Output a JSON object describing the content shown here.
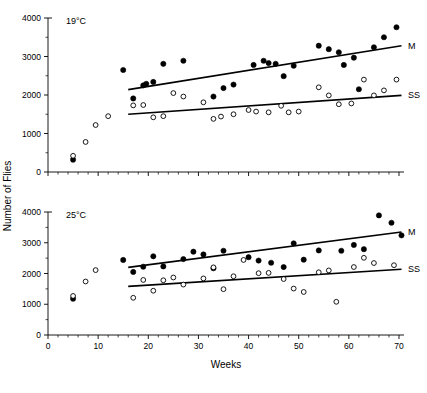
{
  "figure": {
    "width": 427,
    "height": 393,
    "background": "#ffffff",
    "ink_color": "#000000"
  },
  "axis_titles": {
    "y": "Number of Flies",
    "x": "Weeks"
  },
  "chart_data": [
    {
      "type": "scatter",
      "panel_id": "top",
      "title": "19°C",
      "xlabel": "Weeks",
      "ylabel": "Number of Flies",
      "xlim": [
        0,
        71
      ],
      "ylim": [
        0,
        4000
      ],
      "xticks": [
        0,
        10,
        20,
        30,
        40,
        50,
        60,
        70
      ],
      "xtick_labels": [
        "0",
        "10",
        "20",
        "30",
        "40",
        "50",
        "60",
        "70"
      ],
      "yticks": [
        0,
        1000,
        2000,
        3000,
        4000
      ],
      "ytick_labels": [
        "0",
        "1000",
        "2000",
        "3000",
        "4000"
      ],
      "minor_xtick_interval": 2,
      "minor_ytick_interval": 500,
      "grid": false,
      "legend_position": "right-inline",
      "series": [
        {
          "name": "M",
          "label": "M",
          "marker": "filled-circle",
          "color": "#000000",
          "points": [
            [
              5.0,
              320
            ],
            [
              15.0,
              2650
            ],
            [
              17.0,
              1910
            ],
            [
              19.0,
              2250
            ],
            [
              19.6,
              2290
            ],
            [
              21.0,
              2340
            ],
            [
              23.0,
              2810
            ],
            [
              27.0,
              2890
            ],
            [
              33.0,
              1960
            ],
            [
              35.0,
              2180
            ],
            [
              37.0,
              2270
            ],
            [
              41.0,
              2780
            ],
            [
              43.0,
              2890
            ],
            [
              44.0,
              2830
            ],
            [
              45.4,
              2810
            ],
            [
              47.0,
              2490
            ],
            [
              49.0,
              2760
            ],
            [
              54.0,
              3280
            ],
            [
              56.0,
              3190
            ],
            [
              58.0,
              3110
            ],
            [
              59.0,
              2780
            ],
            [
              61.0,
              2970
            ],
            [
              62.0,
              2150
            ],
            [
              65.0,
              3240
            ],
            [
              67.0,
              3500
            ],
            [
              69.5,
              3760
            ]
          ],
          "regression_line": {
            "x1": 16.0,
            "y1": 2140,
            "x2": 70.5,
            "y2": 3280
          }
        },
        {
          "name": "SS",
          "label": "SS",
          "marker": "open-circle",
          "color": "#000000",
          "points": [
            [
              5.0,
              420
            ],
            [
              7.5,
              780
            ],
            [
              9.5,
              1220
            ],
            [
              12.0,
              1450
            ],
            [
              17.0,
              1730
            ],
            [
              19.0,
              1740
            ],
            [
              21.0,
              1420
            ],
            [
              23.0,
              1450
            ],
            [
              25.0,
              2050
            ],
            [
              27.0,
              1960
            ],
            [
              31.0,
              1810
            ],
            [
              33.0,
              1380
            ],
            [
              34.5,
              1440
            ],
            [
              37.0,
              1500
            ],
            [
              40.0,
              1610
            ],
            [
              41.5,
              1570
            ],
            [
              44.0,
              1550
            ],
            [
              46.5,
              1720
            ],
            [
              48.0,
              1550
            ],
            [
              50.0,
              1570
            ],
            [
              54.0,
              2200
            ],
            [
              56.0,
              1990
            ],
            [
              58.0,
              1760
            ],
            [
              60.5,
              1780
            ],
            [
              63.0,
              2400
            ],
            [
              65.0,
              1990
            ],
            [
              67.0,
              2120
            ],
            [
              69.5,
              2400
            ]
          ],
          "regression_line": {
            "x1": 16.0,
            "y1": 1500,
            "x2": 70.5,
            "y2": 1990
          }
        }
      ]
    },
    {
      "type": "scatter",
      "panel_id": "bottom",
      "title": "25°C",
      "xlabel": "Weeks",
      "ylabel": "Number of Flies",
      "xlim": [
        0,
        71
      ],
      "ylim": [
        0,
        4000
      ],
      "xticks": [
        0,
        10,
        20,
        30,
        40,
        50,
        60,
        70
      ],
      "xtick_labels": [
        "0",
        "10",
        "20",
        "30",
        "40",
        "50",
        "60",
        "70"
      ],
      "yticks": [
        0,
        1000,
        2000,
        3000,
        4000
      ],
      "ytick_labels": [
        "0",
        "1000",
        "2000",
        "3000",
        "4000"
      ],
      "minor_xtick_interval": 2,
      "minor_ytick_interval": 500,
      "grid": false,
      "legend_position": "right-inline",
      "series": [
        {
          "name": "M",
          "label": "M",
          "marker": "filled-circle",
          "color": "#000000",
          "points": [
            [
              5.0,
              1180
            ],
            [
              15.0,
              2440
            ],
            [
              17.0,
              2050
            ],
            [
              19.0,
              2220
            ],
            [
              21.0,
              2560
            ],
            [
              23.0,
              2230
            ],
            [
              27.0,
              2470
            ],
            [
              29.0,
              2710
            ],
            [
              31.0,
              2620
            ],
            [
              33.0,
              2170
            ],
            [
              35.0,
              2740
            ],
            [
              40.0,
              2530
            ],
            [
              42.0,
              2420
            ],
            [
              44.5,
              2350
            ],
            [
              47.0,
              2210
            ],
            [
              49.0,
              2980
            ],
            [
              51.0,
              2450
            ],
            [
              54.0,
              2750
            ],
            [
              58.5,
              2740
            ],
            [
              61.0,
              2930
            ],
            [
              63.0,
              2790
            ],
            [
              66.0,
              3890
            ],
            [
              68.5,
              3650
            ],
            [
              70.5,
              3240
            ]
          ],
          "regression_line": {
            "x1": 16.0,
            "y1": 2200,
            "x2": 70.5,
            "y2": 3350
          }
        },
        {
          "name": "SS",
          "label": "SS",
          "marker": "open-circle",
          "color": "#000000",
          "points": [
            [
              5.0,
              1270
            ],
            [
              7.5,
              1740
            ],
            [
              9.5,
              2110
            ],
            [
              17.0,
              1210
            ],
            [
              19.0,
              1790
            ],
            [
              21.0,
              1440
            ],
            [
              23.0,
              1780
            ],
            [
              25.0,
              1870
            ],
            [
              27.0,
              1640
            ],
            [
              31.0,
              1840
            ],
            [
              33.0,
              2200
            ],
            [
              35.0,
              1490
            ],
            [
              37.0,
              1910
            ],
            [
              39.0,
              2440
            ],
            [
              42.0,
              2010
            ],
            [
              44.0,
              2020
            ],
            [
              47.0,
              1820
            ],
            [
              49.0,
              1510
            ],
            [
              51.0,
              1400
            ],
            [
              54.0,
              2040
            ],
            [
              56.0,
              2100
            ],
            [
              57.5,
              1080
            ],
            [
              61.0,
              2210
            ],
            [
              63.0,
              2510
            ],
            [
              65.0,
              2340
            ],
            [
              69.0,
              2270
            ]
          ],
          "regression_line": {
            "x1": 16.0,
            "y1": 1580,
            "x2": 70.5,
            "y2": 2140
          }
        }
      ]
    }
  ]
}
